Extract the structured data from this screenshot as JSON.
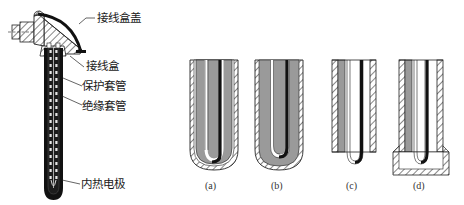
{
  "figure": {
    "left_assembly": {
      "callouts": [
        {
          "id": "terminal-box-cover",
          "text": "接线盒盖"
        },
        {
          "id": "terminal-box",
          "text": "接线盒"
        },
        {
          "id": "protective-sleeve",
          "text": "保护套管"
        },
        {
          "id": "insulating-sleeve",
          "text": "绝缘套管"
        },
        {
          "id": "inner-thermal-electrode",
          "text": "内热电极"
        }
      ]
    },
    "variants": [
      {
        "id": "a",
        "label": "(a)"
      },
      {
        "id": "b",
        "label": "(b)"
      },
      {
        "id": "c",
        "label": "(c)"
      },
      {
        "id": "d",
        "label": "(d)"
      }
    ],
    "colors": {
      "outline": "#1a1a1a",
      "fill_gray": "#9a9a9a",
      "electrode": "#111111",
      "background": "#ffffff"
    }
  }
}
